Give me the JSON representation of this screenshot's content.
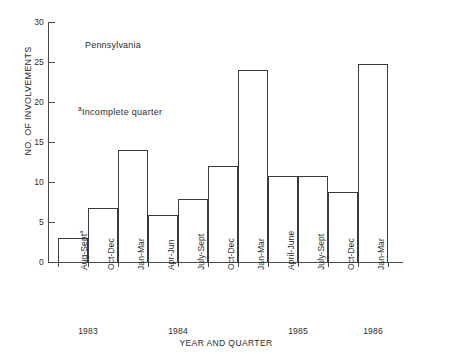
{
  "chart_data": {
    "type": "bar",
    "title": "",
    "annotations": [
      {
        "text": "Pennsylvania",
        "name": "region-label"
      },
      {
        "marker": "a",
        "text": "Incomplete quarter",
        "name": "footnote-note"
      }
    ],
    "xlabel": "YEAR AND QUARTER",
    "ylabel": "NO. OF INVOLVEMENTS",
    "ylim": [
      0,
      30
    ],
    "yticks": [
      0,
      5,
      10,
      15,
      20,
      25,
      30
    ],
    "ytick_labels": [
      "0",
      "5",
      "10",
      "15",
      "20",
      "25",
      "30"
    ],
    "grid": false,
    "legend": false,
    "bar_style": {
      "fill": "none",
      "stroke": "#3a3a3a"
    },
    "categories": [
      "Aug-Sept",
      "Oct-Dec",
      "Jan-Mar",
      "Apr-Jun",
      "July-Sept",
      "Oct-Dec",
      "Jan-Mar",
      "April-June",
      "July-Sept",
      "Oct-Dec",
      "Jan-Mar"
    ],
    "category_markers": [
      "a",
      "",
      "",
      "",
      "",
      "",
      "",
      "",
      "",
      "",
      ""
    ],
    "values": [
      3.0,
      6.8,
      14.0,
      5.9,
      7.9,
      12.0,
      24.0,
      10.8,
      10.8,
      8.8,
      24.8
    ],
    "year_groups": [
      {
        "year": "1983",
        "start": 0,
        "end": 1
      },
      {
        "year": "1984",
        "start": 2,
        "end": 5
      },
      {
        "year": "1985",
        "start": 6,
        "end": 9
      },
      {
        "year": "1986",
        "start": 10,
        "end": 10
      }
    ]
  }
}
